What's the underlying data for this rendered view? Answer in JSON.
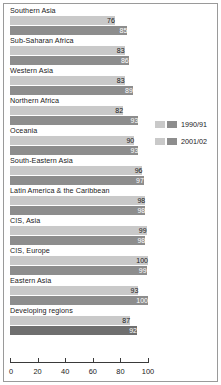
{
  "chart_data": {
    "type": "bar",
    "orientation": "horizontal",
    "title": "",
    "xlabel": "",
    "ylabel": "",
    "xlim": [
      0,
      100
    ],
    "xticks": [
      "0",
      "20",
      "40",
      "60",
      "80",
      "100"
    ],
    "grid": false,
    "legend_position": "right",
    "categories": [
      "Southern Asia",
      "Sub-Saharan Africa",
      "Western Asia",
      "Northern Africa",
      "Oceania",
      "South-Eastern Asia",
      "Latin America & the Caribbean",
      "CIS, Asia",
      "CIS, Europe",
      "Eastern Asia",
      "Developing regions"
    ],
    "series": [
      {
        "name": "1990/91",
        "color": "#c9c9c9",
        "values": [
          76,
          83,
          83,
          82,
          90,
          96,
          98,
          99,
          100,
          93,
          87
        ]
      },
      {
        "name": "2001/02",
        "color": "#8d8d8d",
        "values": [
          85,
          86,
          89,
          93,
          93,
          97,
          98,
          98,
          99,
          100,
          92
        ]
      }
    ]
  },
  "legend": {
    "items": [
      {
        "label": "1990/91"
      },
      {
        "label": "2001/02"
      }
    ]
  }
}
